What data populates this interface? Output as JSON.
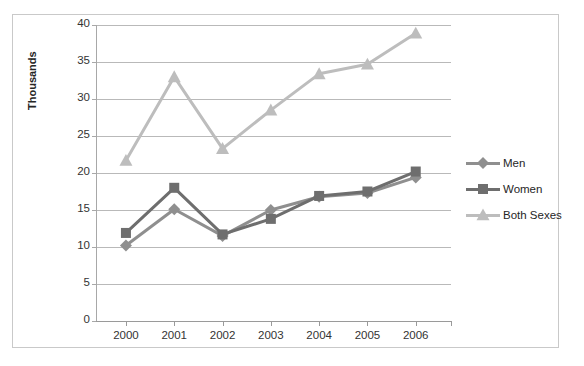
{
  "title_sliver": "",
  "axis": {
    "y_title": "Thousands",
    "y_ticks": [
      "40",
      "35",
      "30",
      "25",
      "20",
      "15",
      "10",
      "5",
      "0"
    ],
    "x_ticks": [
      "2000",
      "2001",
      "2002",
      "2003",
      "2004",
      "2005",
      "2006"
    ]
  },
  "legend": {
    "items": [
      {
        "label": "Men",
        "color": "#8f8f8f",
        "marker": "diamond"
      },
      {
        "label": "Women",
        "color": "#6e6e6e",
        "marker": "square"
      },
      {
        "label": "Both Sexes",
        "color": "#bdbdbd",
        "marker": "triangle"
      }
    ]
  },
  "chart_data": {
    "type": "line",
    "title": "",
    "subtitle": "",
    "xlabel": "",
    "ylabel": "Thousands",
    "categories": [
      "2000",
      "2001",
      "2002",
      "2003",
      "2004",
      "2005",
      "2006"
    ],
    "ylim": [
      0,
      40
    ],
    "ytick_step": 5,
    "grid": true,
    "legend_position": "right",
    "series": [
      {
        "name": "Men",
        "color": "#8f8f8f",
        "marker": "diamond",
        "values": [
          10.2,
          15.1,
          11.5,
          15.0,
          16.8,
          17.3,
          19.4
        ]
      },
      {
        "name": "Women",
        "color": "#6e6e6e",
        "marker": "square",
        "values": [
          11.9,
          18.0,
          11.7,
          13.8,
          16.9,
          17.5,
          20.2
        ]
      },
      {
        "name": "Both Sexes",
        "color": "#bdbdbd",
        "marker": "triangle",
        "values": [
          21.7,
          33.0,
          23.3,
          28.5,
          33.4,
          34.7,
          38.9
        ]
      }
    ]
  }
}
